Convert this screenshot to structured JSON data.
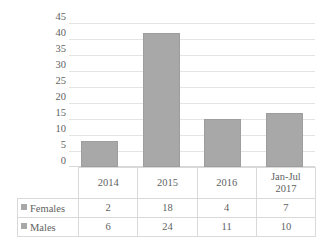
{
  "chart_data": {
    "type": "bar",
    "title": "",
    "xlabel": "",
    "ylabel": "",
    "categories": [
      "2014",
      "2015",
      "2016",
      "Jan-Jul 2017"
    ],
    "category_lines": [
      [
        "2014"
      ],
      [
        "2015"
      ],
      [
        "2016"
      ],
      [
        "Jan-Jul",
        "2017"
      ]
    ],
    "series": [
      {
        "name": "Females",
        "values": [
          2,
          18,
          4,
          7
        ],
        "color": "#a8a8a8"
      },
      {
        "name": "Males",
        "values": [
          6,
          24,
          11,
          10
        ],
        "color": "#a8a8a8"
      }
    ],
    "bar_totals": [
      8,
      42,
      15,
      17
    ],
    "ylim": [
      0,
      45
    ],
    "ytick_step": 5,
    "yticks": [
      "45",
      "40",
      "35",
      "30",
      "25",
      "20",
      "15",
      "10",
      "5",
      "0"
    ],
    "grid": true,
    "legend_position": "table-left",
    "legend_marker": "square-swatch",
    "has_data_table": true
  },
  "table": {
    "category_row": [
      "2014",
      "2015",
      "2016",
      "Jan-Jul 2017"
    ],
    "rows": [
      {
        "label": "Females",
        "values": [
          "2",
          "18",
          "4",
          "7"
        ]
      },
      {
        "label": "Males",
        "values": [
          "6",
          "24",
          "11",
          "10"
        ]
      }
    ]
  },
  "colors": {
    "bar_fill": "#a8a8a8",
    "bar_stroke": "#9d9d9d",
    "gridline": "#e4e4e4",
    "table_border": "#d9d9d9",
    "text": "#5f5f5f",
    "background": "#ffffff"
  }
}
